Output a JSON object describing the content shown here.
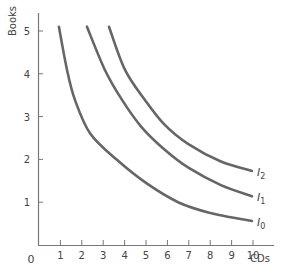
{
  "chart_data": {
    "type": "line",
    "title": "",
    "xlabel": "CDs",
    "ylabel": "Books",
    "xlim": [
      0,
      10.8
    ],
    "ylim": [
      0,
      5.4
    ],
    "x_ticks": [
      "1",
      "2",
      "3",
      "4",
      "5",
      "6",
      "7",
      "8",
      "9",
      "10"
    ],
    "y_ticks": [
      "1",
      "2",
      "3",
      "4",
      "5"
    ],
    "origin_label": "0",
    "grid": false,
    "series": [
      {
        "name": "I0",
        "label_main": "I",
        "label_sub": "0",
        "points": [
          [
            0.93,
            5.1
          ],
          [
            1.31,
            4.09
          ],
          [
            1.68,
            3.39
          ],
          [
            2.4,
            2.6
          ],
          [
            3.64,
            1.99
          ],
          [
            5.0,
            1.45
          ],
          [
            6.5,
            1.0
          ],
          [
            8.0,
            0.75
          ],
          [
            9.95,
            0.56
          ]
        ]
      },
      {
        "name": "I1",
        "label_main": "I",
        "label_sub": "1",
        "points": [
          [
            2.24,
            5.1
          ],
          [
            3.08,
            4.09
          ],
          [
            3.88,
            3.39
          ],
          [
            4.8,
            2.75
          ],
          [
            5.89,
            2.22
          ],
          [
            7.0,
            1.8
          ],
          [
            8.5,
            1.4
          ],
          [
            9.95,
            1.14
          ]
        ]
      },
      {
        "name": "I2",
        "label_main": "I",
        "label_sub": "2",
        "points": [
          [
            3.27,
            5.1
          ],
          [
            4.02,
            4.09
          ],
          [
            4.95,
            3.39
          ],
          [
            5.89,
            2.8
          ],
          [
            7.0,
            2.35
          ],
          [
            8.5,
            1.95
          ],
          [
            9.95,
            1.73
          ]
        ]
      }
    ],
    "line_color": "#666666",
    "axis_color": "#777777"
  }
}
